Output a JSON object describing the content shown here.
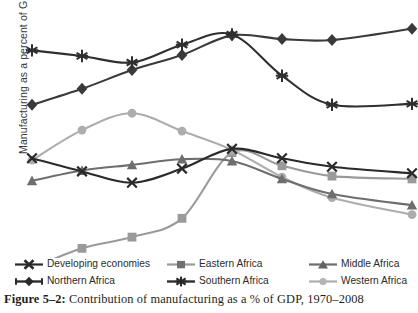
{
  "figure": {
    "caption_label": "Figure 5–2:",
    "caption_text": " Contribution of manufacturing as a % of GDP, 1970–2008"
  },
  "axes": {
    "ylabel": "Manufacturing as a percent of GDP",
    "xlabel": ""
  },
  "legend": {
    "items": [
      {
        "label": "Developing economies",
        "marker": "x-marker-icon",
        "color": "#2a2a2a"
      },
      {
        "label": "Eastern Africa",
        "marker": "square-marker-icon",
        "color": "#9a9a9a"
      },
      {
        "label": "Middle Africa",
        "marker": "triangle-marker-icon",
        "color": "#6e6e6e"
      },
      {
        "label": "Northern Africa",
        "marker": "diamond-marker-icon",
        "color": "#3a3a3a"
      },
      {
        "label": "Southern Africa",
        "marker": "star-marker-icon",
        "color": "#2f2f2f"
      },
      {
        "label": "Western Africa",
        "marker": "circle-marker-icon",
        "color": "#adadad"
      }
    ]
  },
  "chart_data": {
    "type": "line",
    "title": "Contribution of manufacturing as a % of GDP, 1970–2008",
    "xlabel": "",
    "ylabel": "Manufacturing as a percent of GDP",
    "grid": false,
    "legend_position": "bottom",
    "x": [
      1970,
      1975,
      1980,
      1985,
      1990,
      1995,
      2000,
      2008
    ],
    "xlim": [
      1970,
      2008
    ],
    "ylim": [
      0,
      26
    ],
    "series": [
      {
        "name": "Southern Africa",
        "marker": "star",
        "color": "#2f2f2f",
        "width": 2.1,
        "values": [
          21.7,
          21.1,
          20.4,
          22.3,
          23.4,
          19.0,
          15.9,
          16.0
        ]
      },
      {
        "name": "Northern Africa",
        "marker": "diamond",
        "color": "#3a3a3a",
        "width": 2.1,
        "values": [
          15.9,
          17.6,
          19.6,
          21.2,
          23.3,
          22.9,
          22.8,
          24.0
        ]
      },
      {
        "name": "Western Africa",
        "marker": "circle",
        "color": "#adadad",
        "width": 2.1,
        "values": [
          10.0,
          13.2,
          15.0,
          13.1,
          11.1,
          8.2,
          6.0,
          4.2
        ]
      },
      {
        "name": "Developing economies",
        "marker": "x",
        "color": "#2a2a2a",
        "width": 2.1,
        "values": [
          10.2,
          8.8,
          7.6,
          9.1,
          11.2,
          10.2,
          9.3,
          8.6
        ]
      },
      {
        "name": "Middle Africa",
        "marker": "triangle",
        "color": "#6e6e6e",
        "width": 2.1,
        "values": [
          7.8,
          8.9,
          9.5,
          10.1,
          9.9,
          8.0,
          6.4,
          5.2
        ]
      },
      {
        "name": "Eastern Africa",
        "marker": "square",
        "color": "#9a9a9a",
        "width": 2.1,
        "values": [
          -1.5,
          0.6,
          1.8,
          3.8,
          10.8,
          9.4,
          8.3,
          8.0
        ]
      }
    ]
  }
}
